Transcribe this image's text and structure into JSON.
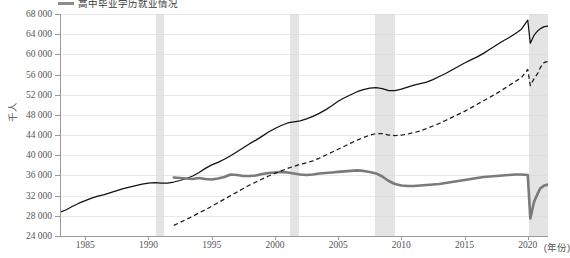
{
  "chart_data": {
    "type": "line",
    "title": "",
    "xlabel": "(年份)",
    "ylabel": "千人",
    "xlim": [
      1983.0,
      2021.6
    ],
    "ylim": [
      24000,
      68000
    ],
    "ytick_step": 4000,
    "yticks": [
      "24 000",
      "28 000",
      "32 000",
      "36 000",
      "40 000",
      "44 000",
      "48 000",
      "52 000",
      "56 000",
      "60 000",
      "64 000",
      "68 000"
    ],
    "ytick_values": [
      24000,
      28000,
      32000,
      36000,
      40000,
      44000,
      48000,
      52000,
      56000,
      60000,
      64000,
      68000
    ],
    "xticks": [
      "1985",
      "1990",
      "1995",
      "2000",
      "2005",
      "2010",
      "2015",
      "2020"
    ],
    "xtick_values": [
      1985,
      1990,
      1995,
      2000,
      2005,
      2010,
      2015,
      2020
    ],
    "grid": "horizontal",
    "legend_position": "top-left",
    "legend": [
      {
        "label": "高中毕业学历就业情况",
        "color": "#8c8c8c",
        "style": "solid-thick"
      }
    ],
    "shaded_bands": [
      {
        "name": "recession-1990",
        "start": 1990.6,
        "end": 1991.2
      },
      {
        "name": "recession-2001",
        "start": 2001.2,
        "end": 2001.9
      },
      {
        "name": "recession-2008",
        "start": 2007.95,
        "end": 2009.5
      },
      {
        "name": "recession-2020",
        "start": 2020.1,
        "end": 2021.6
      }
    ],
    "series": [
      {
        "name": "series-solid-black",
        "style": "solid",
        "color": "#111111",
        "x": [
          1983.0,
          1983.5,
          1984.0,
          1984.5,
          1985.0,
          1985.5,
          1986.0,
          1986.5,
          1987.0,
          1987.5,
          1988.0,
          1988.5,
          1989.0,
          1989.5,
          1990.0,
          1990.5,
          1991.0,
          1991.5,
          1992.0,
          1992.5,
          1993.0,
          1993.5,
          1994.0,
          1994.5,
          1995.0,
          1995.5,
          1996.0,
          1996.5,
          1997.0,
          1997.5,
          1998.0,
          1998.5,
          1999.0,
          1999.5,
          2000.0,
          2000.5,
          2001.0,
          2001.5,
          2002.0,
          2002.5,
          2003.0,
          2003.5,
          2004.0,
          2004.5,
          2005.0,
          2005.5,
          2006.0,
          2006.5,
          2007.0,
          2007.5,
          2008.0,
          2008.5,
          2009.0,
          2009.5,
          2010.0,
          2010.5,
          2011.0,
          2011.5,
          2012.0,
          2012.5,
          2013.0,
          2013.5,
          2014.0,
          2014.5,
          2015.0,
          2015.5,
          2016.0,
          2016.5,
          2017.0,
          2017.5,
          2018.0,
          2018.5,
          2019.0,
          2019.5,
          2020.0,
          2020.2,
          2020.5,
          2020.8,
          2021.0,
          2021.3,
          2021.6
        ],
        "y": [
          28700,
          29200,
          29900,
          30500,
          31000,
          31500,
          31900,
          32200,
          32600,
          33000,
          33400,
          33700,
          34000,
          34300,
          34500,
          34600,
          34500,
          34500,
          34700,
          35000,
          35400,
          35900,
          36600,
          37400,
          38100,
          38600,
          39200,
          39900,
          40700,
          41500,
          42300,
          43000,
          43800,
          44600,
          45300,
          45900,
          46400,
          46600,
          46800,
          47200,
          47700,
          48300,
          49000,
          49800,
          50700,
          51400,
          52000,
          52600,
          53000,
          53300,
          53400,
          53200,
          52800,
          52800,
          53100,
          53500,
          53900,
          54200,
          54500,
          55000,
          55600,
          56200,
          56900,
          57600,
          58300,
          58900,
          59500,
          60200,
          61000,
          61800,
          62600,
          63300,
          64100,
          65000,
          66800,
          62200,
          63800,
          64700,
          65100,
          65500,
          65600
        ]
      },
      {
        "name": "series-thick-gray",
        "style": "solid-thick",
        "color": "#7a7a7a",
        "x": [
          1992.0,
          1992.5,
          1993.0,
          1993.5,
          1994.0,
          1994.5,
          1995.0,
          1995.5,
          1996.0,
          1996.5,
          1997.0,
          1997.5,
          1998.0,
          1998.5,
          1999.0,
          1999.5,
          2000.0,
          2000.5,
          2001.0,
          2001.5,
          2002.0,
          2002.5,
          2003.0,
          2003.5,
          2004.0,
          2004.5,
          2005.0,
          2005.5,
          2006.0,
          2006.5,
          2007.0,
          2007.5,
          2008.0,
          2008.5,
          2009.0,
          2009.5,
          2010.0,
          2010.5,
          2011.0,
          2011.5,
          2012.0,
          2012.5,
          2013.0,
          2013.5,
          2014.0,
          2014.5,
          2015.0,
          2015.5,
          2016.0,
          2016.5,
          2017.0,
          2017.5,
          2018.0,
          2018.5,
          2019.0,
          2019.5,
          2020.0,
          2020.2,
          2020.5,
          2020.8,
          2021.0,
          2021.3,
          2021.6
        ],
        "y": [
          35600,
          35500,
          35400,
          35300,
          35500,
          35300,
          35200,
          35400,
          35700,
          36200,
          36100,
          35900,
          35900,
          36000,
          36300,
          36500,
          36600,
          36700,
          36600,
          36400,
          36200,
          36100,
          36200,
          36400,
          36500,
          36600,
          36700,
          36800,
          36900,
          37000,
          36900,
          36700,
          36400,
          35800,
          34900,
          34300,
          34000,
          33900,
          33900,
          34000,
          34100,
          34200,
          34300,
          34500,
          34700,
          34900,
          35100,
          35300,
          35500,
          35700,
          35800,
          35900,
          36000,
          36100,
          36200,
          36200,
          36100,
          27500,
          30800,
          32500,
          33500,
          34000,
          34200
        ]
      },
      {
        "name": "series-dashed-black",
        "style": "dashed",
        "color": "#1a1a1a",
        "x": [
          1992.0,
          1992.5,
          1993.0,
          1993.5,
          1994.0,
          1994.5,
          1995.0,
          1995.5,
          1996.0,
          1996.5,
          1997.0,
          1997.5,
          1998.0,
          1998.5,
          1999.0,
          1999.5,
          2000.0,
          2000.5,
          2001.0,
          2001.5,
          2002.0,
          2002.5,
          2003.0,
          2003.5,
          2004.0,
          2004.5,
          2005.0,
          2005.5,
          2006.0,
          2006.5,
          2007.0,
          2007.5,
          2008.0,
          2008.5,
          2009.0,
          2009.5,
          2010.0,
          2010.5,
          2011.0,
          2011.5,
          2012.0,
          2012.5,
          2013.0,
          2013.5,
          2014.0,
          2014.5,
          2015.0,
          2015.5,
          2016.0,
          2016.5,
          2017.0,
          2017.5,
          2018.0,
          2018.5,
          2019.0,
          2019.5,
          2020.0,
          2020.2,
          2020.5,
          2020.8,
          2021.0,
          2021.3,
          2021.6
        ],
        "y": [
          26100,
          26700,
          27300,
          27900,
          28600,
          29200,
          29900,
          30600,
          31300,
          32000,
          32700,
          33400,
          34100,
          34700,
          35300,
          35900,
          36400,
          36900,
          37400,
          37800,
          38200,
          38500,
          38900,
          39400,
          40000,
          40600,
          41200,
          41800,
          42400,
          43000,
          43500,
          44000,
          44300,
          44300,
          44000,
          43900,
          44000,
          44200,
          44500,
          44800,
          45300,
          45800,
          46300,
          46900,
          47500,
          48100,
          48700,
          49400,
          50100,
          50800,
          51500,
          52200,
          53000,
          53800,
          54600,
          55400,
          57000,
          53800,
          55200,
          56300,
          57400,
          58400,
          58600
        ]
      }
    ]
  },
  "axis": {
    "y_unit": "千人",
    "x_unit": "(年份)"
  }
}
